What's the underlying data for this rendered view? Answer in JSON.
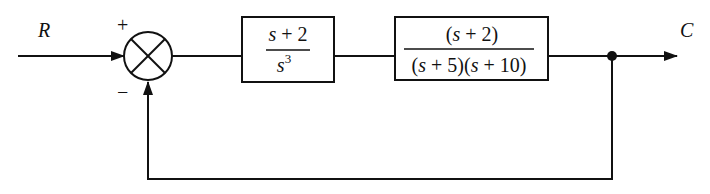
{
  "diagram": {
    "type": "block-diagram",
    "input_label": "R",
    "output_label": "C",
    "summing_junction": {
      "plus_sign": "+",
      "minus_sign": "−"
    },
    "blocks": [
      {
        "id": "G1",
        "numerator": "s + 2",
        "denominator_base": "s",
        "denominator_exponent": "3"
      },
      {
        "id": "G2",
        "numerator": "(s + 2)",
        "denominator": "(s + 5)(s + 10)"
      }
    ],
    "feedback": "unity negative feedback"
  },
  "colors": {
    "line": "#111111",
    "background": "#ffffff"
  }
}
